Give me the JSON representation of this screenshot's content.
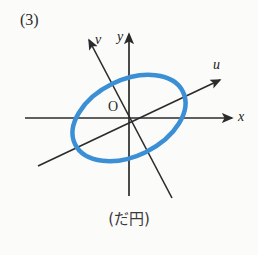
{
  "page": {
    "background_color": "#fbfbfa",
    "item_number": "(3)",
    "caption": "(だ円)"
  },
  "figure": {
    "name": "rotated-ellipse-with-uv-axes",
    "origin_label": "O",
    "origin": {
      "x": 129,
      "y": 118
    },
    "colors": {
      "axis": "#2b2b2b",
      "curve": "#3b8fd4",
      "text": "#2b2b2b"
    },
    "axes": [
      {
        "id": "x",
        "label": "x",
        "type": "horizontal",
        "x1": 25,
        "y1": 118,
        "x2": 232,
        "y2": 118,
        "arrow": "end"
      },
      {
        "id": "y",
        "label": "y",
        "type": "vertical",
        "x1": 129,
        "y1": 196,
        "x2": 129,
        "y2": 33,
        "arrow": "end"
      },
      {
        "id": "u",
        "label": "u",
        "type": "oblique",
        "x1": 38,
        "y1": 166,
        "x2": 221,
        "y2": 79,
        "arrow": "end"
      },
      {
        "id": "v",
        "label": "v",
        "type": "oblique",
        "x1": 172,
        "y1": 198,
        "x2": 88,
        "y2": 39,
        "arrow": "end"
      }
    ],
    "ellipse": {
      "center_x": 129,
      "center_y": 118,
      "radius_x": 60,
      "radius_y": 38,
      "rotation_deg": -26,
      "stroke_color": "#3b8fd4",
      "stroke_width": 4.5,
      "fill": "none"
    }
  }
}
